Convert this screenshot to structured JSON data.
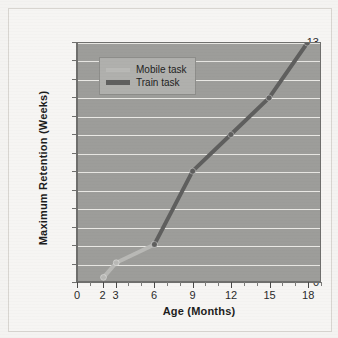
{
  "chart_data": {
    "type": "line",
    "title": "",
    "xlabel": "Age (Months)",
    "ylabel": "Maximum Retention (Weeks)",
    "xlim": [
      0,
      19
    ],
    "ylim": [
      0,
      13
    ],
    "grid": true,
    "legend_position": "top-left",
    "x_ticks": [
      0,
      2,
      3,
      6,
      9,
      12,
      15,
      18
    ],
    "x_tick_labels": [
      "0",
      "2",
      "3",
      "6",
      "9",
      "12",
      "15",
      "18"
    ],
    "x_minor_ticks": [
      1,
      4,
      5,
      7,
      8,
      10,
      11,
      13,
      14,
      16,
      17,
      19
    ],
    "y_ticks": [
      0,
      1,
      2,
      3,
      4,
      5,
      6,
      7,
      8,
      9,
      10,
      11,
      12,
      13
    ],
    "y_tick_labels": [
      "0",
      "1",
      "2",
      "3",
      "4",
      "5",
      "6",
      "7",
      "8",
      "9",
      "10",
      "11",
      "12",
      "13"
    ],
    "series": [
      {
        "name": "Mobile task",
        "color": "#b9b9b6",
        "x": [
          2,
          3,
          6
        ],
        "y": [
          0.2,
          1,
          2
        ],
        "values": [
          0.2,
          1,
          2
        ]
      },
      {
        "name": "Train task",
        "color": "#5f5f5e",
        "x": [
          6,
          9,
          12,
          15,
          18
        ],
        "y": [
          2,
          6,
          8,
          10,
          13
        ],
        "values": [
          2,
          6,
          8,
          10,
          13
        ]
      }
    ]
  },
  "legend": {
    "items": [
      {
        "label": "Mobile task",
        "color": "#b9b9b6"
      },
      {
        "label": "Train task",
        "color": "#5f5f5e"
      }
    ]
  },
  "axes": {
    "x_title": "Age (Months)",
    "y_title": "Maximum Retention (Weeks)"
  },
  "colors": {
    "page_background": "#f4f3f1",
    "figure_background": "#f6f5f3",
    "plot_background": "#9d9d9a",
    "gridline": "#e9e8e4",
    "axis": "#6f6f6d",
    "legend_background": "#b0b0ad",
    "mobile_task": "#b9b9b6",
    "train_task": "#5f5f5e",
    "text": "#1d1d1d"
  }
}
